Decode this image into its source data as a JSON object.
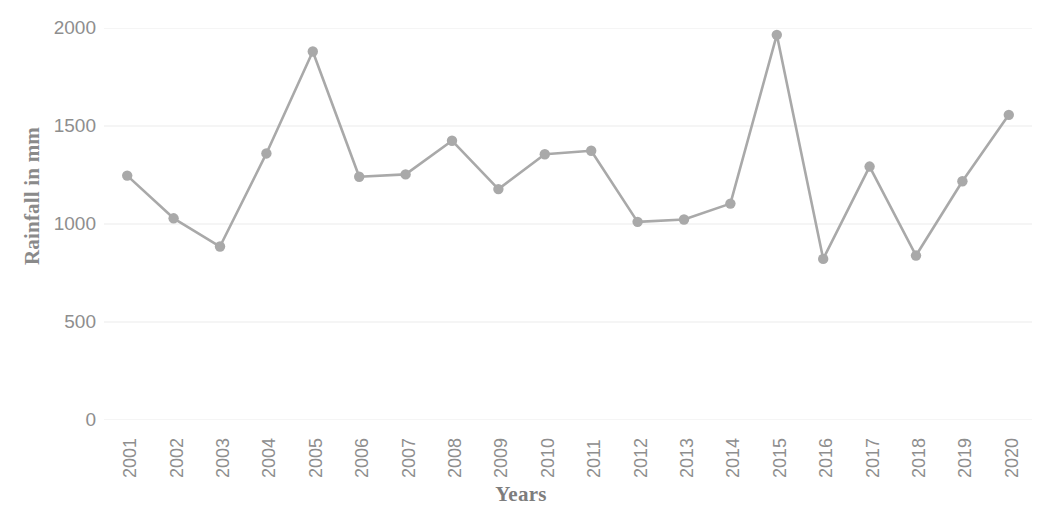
{
  "chart_data": {
    "type": "line",
    "title": "",
    "subtitle": "",
    "xlabel": "Years",
    "ylabel": "Rainfall in mm",
    "categories": [
      "2001",
      "2002",
      "2003",
      "2004",
      "2005",
      "2006",
      "2007",
      "2008",
      "2009",
      "2010",
      "2011",
      "2012",
      "2013",
      "2014",
      "2015",
      "2016",
      "2017",
      "2018",
      "2019",
      "2020"
    ],
    "values": [
      1247,
      1029,
      885,
      1360,
      1880,
      1241,
      1253,
      1425,
      1178,
      1356,
      1374,
      1011,
      1023,
      1104,
      1965,
      822,
      1293,
      839,
      1218,
      1557
    ],
    "series": [
      {
        "name": "Rainfall",
        "values": [
          1247,
          1029,
          885,
          1360,
          1880,
          1241,
          1253,
          1425,
          1178,
          1356,
          1374,
          1011,
          1023,
          1104,
          1965,
          822,
          1293,
          839,
          1218,
          1557
        ]
      }
    ],
    "ylim": [
      0,
      2000
    ],
    "y_ticks": [
      0,
      500,
      1000,
      1500,
      2000
    ],
    "y_tick_labels": [
      "0",
      "500",
      "1000",
      "1500",
      "2000"
    ],
    "grid": true,
    "grid_axis": "y",
    "legend": false,
    "legend_position": "none",
    "marker": "circle",
    "line_color": "#a9a9a9",
    "marker_color": "#a9a9a9",
    "grid_color": "#f2f2f2",
    "axis_label_color": "#8e8e8e",
    "background_color": "#ffffff",
    "x_tick_rotation": -90
  }
}
